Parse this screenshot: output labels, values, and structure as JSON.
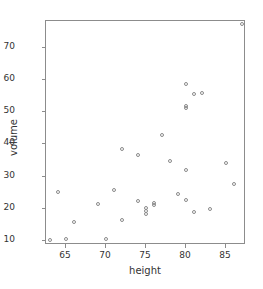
{
  "chart_data": {
    "type": "scatter",
    "title": "",
    "xlabel": "height",
    "ylabel": "volume",
    "xlim": [
      62.5,
      87.5
    ],
    "ylim": [
      8.5,
      78.0
    ],
    "xticks": [
      65,
      70,
      75,
      80,
      85
    ],
    "yticks": [
      10,
      20,
      30,
      40,
      50,
      60,
      70
    ],
    "xtick_labels": [
      "65",
      "70",
      "75",
      "80",
      "85"
    ],
    "ytick_labels": [
      "10",
      "20",
      "30",
      "40",
      "50",
      "60",
      "70"
    ],
    "grid": false,
    "legend": null,
    "marker": "open-circle",
    "marker_color": "#8a8a8a",
    "n_points": 31,
    "x": [
      70,
      65,
      63,
      72,
      81,
      83,
      66,
      75,
      80,
      75,
      79,
      76,
      76,
      69,
      75,
      74,
      85,
      86,
      71,
      64,
      78,
      80,
      74,
      72,
      77,
      81,
      82,
      80,
      80,
      80,
      87
    ],
    "y": [
      10.3,
      10.3,
      10.2,
      16.4,
      18.8,
      19.7,
      15.6,
      18.2,
      22.6,
      19.9,
      24.2,
      21.0,
      21.4,
      21.3,
      19.1,
      22.2,
      33.8,
      27.4,
      25.7,
      24.9,
      34.5,
      31.7,
      36.3,
      38.3,
      42.6,
      55.4,
      55.7,
      58.3,
      51.5,
      51.0,
      77.0
    ],
    "points": [
      {
        "x": 70,
        "y": 10.3
      },
      {
        "x": 65,
        "y": 10.3
      },
      {
        "x": 63,
        "y": 10.2
      },
      {
        "x": 72,
        "y": 16.4
      },
      {
        "x": 81,
        "y": 18.8
      },
      {
        "x": 83,
        "y": 19.7
      },
      {
        "x": 66,
        "y": 15.6
      },
      {
        "x": 75,
        "y": 18.2
      },
      {
        "x": 80,
        "y": 22.6
      },
      {
        "x": 75,
        "y": 19.9
      },
      {
        "x": 79,
        "y": 24.2
      },
      {
        "x": 76,
        "y": 21.0
      },
      {
        "x": 76,
        "y": 21.4
      },
      {
        "x": 69,
        "y": 21.3
      },
      {
        "x": 75,
        "y": 19.1
      },
      {
        "x": 74,
        "y": 22.2
      },
      {
        "x": 85,
        "y": 33.8
      },
      {
        "x": 86,
        "y": 27.4
      },
      {
        "x": 71,
        "y": 25.7
      },
      {
        "x": 64,
        "y": 24.9
      },
      {
        "x": 78,
        "y": 34.5
      },
      {
        "x": 80,
        "y": 31.7
      },
      {
        "x": 74,
        "y": 36.3
      },
      {
        "x": 72,
        "y": 38.3
      },
      {
        "x": 77,
        "y": 42.6
      },
      {
        "x": 81,
        "y": 55.4
      },
      {
        "x": 82,
        "y": 55.7
      },
      {
        "x": 80,
        "y": 58.3
      },
      {
        "x": 80,
        "y": 51.5
      },
      {
        "x": 80,
        "y": 51.0
      },
      {
        "x": 87,
        "y": 77.0
      }
    ]
  }
}
